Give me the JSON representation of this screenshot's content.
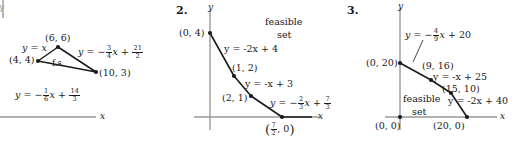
{
  "document": {
    "type": "math-figures",
    "topic": "linear-programming-feasible-sets",
    "background": "#ffffff",
    "axis_color": "#9a9a9a",
    "line_color": "#1a1a1a"
  },
  "figures": [
    {
      "number": "",
      "number_visible": false,
      "axis_x_label": "x",
      "axis_y_label": "y",
      "region_label": "f.s.",
      "vertices": [
        {
          "label": "(6, 6)",
          "x": 6,
          "y": 6
        },
        {
          "label": "(4, 4)",
          "x": 4,
          "y": 4
        },
        {
          "label": "(10, 3)",
          "x": 10,
          "y": 3
        }
      ],
      "equations": [
        {
          "id": "eq-left",
          "text": "y = x",
          "lhs": "y",
          "rel": "=",
          "rhs": "x"
        },
        {
          "id": "eq-top",
          "text": "y = -3/4 x + 21/2",
          "slope_num": "3",
          "slope_den": "4",
          "int_num": "21",
          "int_den": "2"
        },
        {
          "id": "eq-bottom",
          "text": "y = -1/6 x + 14/3",
          "slope_num": "1",
          "slope_den": "6",
          "int_num": "14",
          "int_den": "3"
        }
      ]
    },
    {
      "number": "2.",
      "number_visible": true,
      "axis_x_label": "x",
      "axis_y_label": "y",
      "region_label_line1": "feasible",
      "region_label_line2": "set",
      "vertices": [
        {
          "label": "(0, 4)",
          "x": 0,
          "y": 4
        },
        {
          "label": "(1, 2)",
          "x": 1,
          "y": 2
        },
        {
          "label": "(2, 1)",
          "x": 2,
          "y": 1
        },
        {
          "label": "(7/2, 0)",
          "x": 3.5,
          "y": 0
        }
      ],
      "equations": [
        {
          "id": "eq-1",
          "text": "y = -2x + 4"
        },
        {
          "id": "eq-2",
          "text": "y = -x + 3"
        },
        {
          "id": "eq-3",
          "text": "y = -2/3 x + 7/3",
          "slope_num": "2",
          "slope_den": "3",
          "int_num": "7",
          "int_den": "3"
        }
      ]
    },
    {
      "number": "3.",
      "number_visible": true,
      "axis_x_label": "x",
      "axis_y_label": "y",
      "region_label_line1": "feasible",
      "region_label_line2": "set",
      "vertices": [
        {
          "label": "(0, 20)",
          "x": 0,
          "y": 20
        },
        {
          "label": "(9, 16)",
          "x": 9,
          "y": 16
        },
        {
          "label": "(15, 10)",
          "x": 15,
          "y": 10
        },
        {
          "label": "(20, 0)",
          "x": 20,
          "y": 0
        },
        {
          "label": "(0, 0)",
          "x": 0,
          "y": 0
        }
      ],
      "equations": [
        {
          "id": "eq-1",
          "text": "y = -4/9 x + 20",
          "slope_num": "4",
          "slope_den": "9",
          "int": "20"
        },
        {
          "id": "eq-2",
          "text": "y = -x + 25"
        },
        {
          "id": "eq-3",
          "text": "y = -2x + 40"
        }
      ]
    }
  ],
  "glyphs": {
    "eq": "=",
    "minus": "−",
    "x_var": "x",
    "y_var": "y",
    "plus": "+",
    "comma": ","
  }
}
